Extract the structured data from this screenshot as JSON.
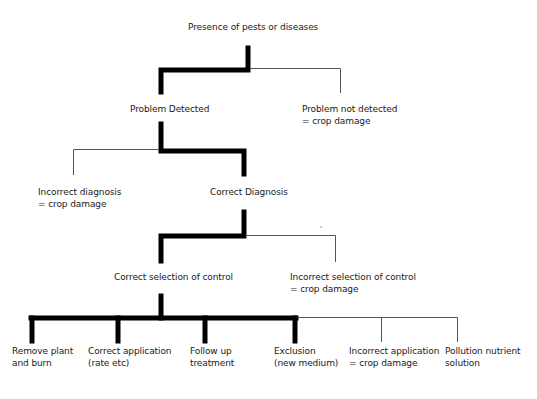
{
  "diagram": {
    "type": "decision-tree",
    "colors": {
      "success_path": "#000000",
      "failure_path": "#555555",
      "background": "#ffffff",
      "text": "#1a1a1a"
    },
    "root": {
      "line1": "Presence of pests or diseases"
    },
    "level1": {
      "success": {
        "line1": "Problem Detected"
      },
      "failure": {
        "line1": "Problem not detected",
        "line2": "= crop damage"
      }
    },
    "level2": {
      "failure": {
        "line1": "Incorrect diagnosis",
        "line2": "= crop damage"
      },
      "success": {
        "line1": "Correct Diagnosis"
      }
    },
    "level3": {
      "success": {
        "line1": "Correct selection of control"
      },
      "failure": {
        "line1": "Incorrect selection of control",
        "line2": "= crop damage"
      }
    },
    "level4": {
      "outcomes": [
        {
          "line1": "Remove plant",
          "line2": "and burn",
          "path": "success"
        },
        {
          "line1": "Correct application",
          "line2": "(rate etc)",
          "path": "success"
        },
        {
          "line1": "Follow up",
          "line2": "treatment",
          "path": "success"
        },
        {
          "line1": "Exclusion",
          "line2": "(new medium)",
          "path": "success"
        },
        {
          "line1": "Incorrect application",
          "line2": "= crop damage",
          "path": "failure"
        },
        {
          "line1": "Pollution nutrient",
          "line2": "solution",
          "path": "failure"
        }
      ]
    }
  }
}
